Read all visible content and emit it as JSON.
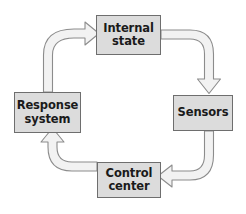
{
  "diagram": {
    "type": "cycle",
    "direction": "clockwise",
    "background_color": "#ffffff",
    "node_fill_color": "#dcdcdc",
    "node_border_color": "#6e6e6e",
    "arrow_fill_color": "#f2f2f2",
    "arrow_stroke_color": "#8c8c8c",
    "nodes": [
      {
        "id": "internal-state",
        "label_line1": "Internal",
        "label_line2": "state"
      },
      {
        "id": "sensors",
        "label_line1": "Sensors",
        "label_line2": ""
      },
      {
        "id": "control-center",
        "label_line1": "Control",
        "label_line2": "center"
      },
      {
        "id": "response-system",
        "label_line1": "Response",
        "label_line2": "system"
      }
    ],
    "edges": [
      {
        "id": "internal-state-to-sensors",
        "from": "internal-state",
        "to": "sensors",
        "shape": "curved-block-arrow",
        "head_direction": "down"
      },
      {
        "id": "sensors-to-control-center",
        "from": "sensors",
        "to": "control-center",
        "shape": "curved-block-arrow",
        "head_direction": "left"
      },
      {
        "id": "control-center-to-response-system",
        "from": "control-center",
        "to": "response-system",
        "shape": "curved-block-arrow",
        "head_direction": "up"
      },
      {
        "id": "response-system-to-internal-state",
        "from": "response-system",
        "to": "internal-state",
        "shape": "curved-block-arrow",
        "head_direction": "right"
      }
    ]
  }
}
